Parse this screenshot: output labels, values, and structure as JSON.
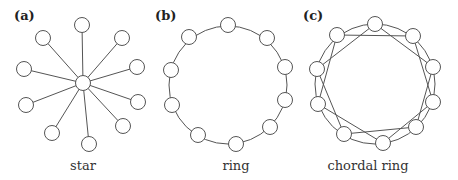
{
  "figure": {
    "panels": [
      {
        "id": "a",
        "label": "(a)",
        "caption": "star",
        "type": "star",
        "label_pos": [
          14,
          20
        ],
        "caption_pos": [
          83,
          170
        ],
        "center": [
          83,
          83
        ],
        "leaves": [
          [
            82,
            25
          ],
          [
            122,
            38
          ],
          [
            137,
            67
          ],
          [
            138,
            102
          ],
          [
            123,
            126
          ],
          [
            89,
            144
          ],
          [
            52,
            133
          ],
          [
            26,
            105
          ],
          [
            24,
            69
          ],
          [
            43,
            38
          ]
        ]
      },
      {
        "id": "b",
        "label": "(b)",
        "caption": "ring",
        "type": "ring",
        "label_pos": [
          155,
          20
        ],
        "caption_pos": [
          236,
          170
        ],
        "ring_center": [
          228,
          85
        ],
        "ring_radius": 59,
        "nodes": [
          [
            228,
            25
          ],
          [
            267,
            38
          ],
          [
            285,
            67
          ],
          [
            285,
            100
          ],
          [
            270,
            127
          ],
          [
            236,
            144
          ],
          [
            198,
            135
          ],
          [
            172,
            105
          ],
          [
            171,
            70
          ],
          [
            189,
            37
          ]
        ]
      },
      {
        "id": "c",
        "label": "(c)",
        "caption": "chordal ring",
        "type": "chordal-ring",
        "label_pos": [
          303,
          20
        ],
        "caption_pos": [
          368,
          170
        ],
        "ring_center": [
          375,
          84
        ],
        "ring_radius": 60,
        "chord_skip": 2,
        "nodes": [
          [
            375,
            24
          ],
          [
            413,
            36
          ],
          [
            433,
            67
          ],
          [
            433,
            102
          ],
          [
            416,
            127
          ],
          [
            383,
            143
          ],
          [
            344,
            134
          ],
          [
            318,
            104
          ],
          [
            317,
            69
          ],
          [
            337,
            35
          ]
        ]
      }
    ],
    "node_radius": 7.5,
    "colors": {
      "stroke": "#555555",
      "fill": "#ffffff",
      "text": "#333333"
    }
  }
}
